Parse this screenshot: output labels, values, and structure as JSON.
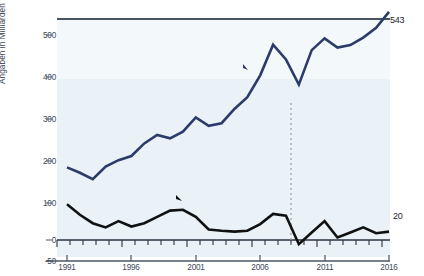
{
  "chart_data": {
    "type": "line",
    "title": "",
    "xlabel": "",
    "ylabel": "Angaben in Milliarden Euro",
    "xlim": [
      1991,
      2016
    ],
    "ylim": [
      -50,
      550
    ],
    "ytick_labels": [
      "500",
      "400",
      "300",
      "200",
      "100",
      "0",
      "-50"
    ],
    "ytick_values": [
      500,
      400,
      300,
      200,
      100,
      0,
      -50
    ],
    "xtick_labels": [
      "1991",
      "1996",
      "2001",
      "2006",
      "2011",
      "2016"
    ],
    "xtick_values": [
      1991,
      1996,
      2001,
      2006,
      2011,
      2016
    ],
    "grid": false,
    "legend_position": "inline-labels",
    "x": [
      1991,
      1992,
      1993,
      1994,
      1995,
      1996,
      1997,
      1998,
      1999,
      2000,
      2001,
      2002,
      2003,
      2004,
      2005,
      2006,
      2007,
      2008,
      2009,
      2010,
      2011,
      2012,
      2013,
      2014,
      2015,
      2016
    ],
    "series": [
      {
        "name": "Unternehmensgewinne",
        "color": "#2b3c6b",
        "values": [
          173,
          160,
          145,
          175,
          190,
          200,
          230,
          250,
          242,
          258,
          292,
          272,
          278,
          312,
          340,
          392,
          465,
          430,
          370,
          452,
          480,
          458,
          464,
          482,
          505,
          543
        ],
        "label_start": "173",
        "label_end": "543"
      },
      {
        "name": "Nettoinvestitionen",
        "color": "#111111",
        "values": [
          85,
          60,
          40,
          30,
          45,
          32,
          40,
          55,
          70,
          72,
          55,
          25,
          22,
          20,
          22,
          38,
          62,
          58,
          -10,
          18,
          45,
          6,
          18,
          30,
          16,
          20
        ],
        "label_start": "85",
        "label_end": "20"
      }
    ],
    "annotations": [
      {
        "text": "Wirtschaftskrise",
        "x": 2009,
        "note": "dashed vertical marker at 2009"
      }
    ]
  },
  "labels": {
    "axis_y_title": "Angaben in Milliarden Euro",
    "profit_tag": "Unternehmensgewinne",
    "invest_tag": "Nettoinvestitionen",
    "crisis": "Wirtschaftskrise",
    "profit_start": "173",
    "profit_end": "543",
    "invest_start": "85",
    "invest_end": "20"
  },
  "ytick_labels": [
    "500",
    "400",
    "300",
    "200",
    "100",
    "0",
    "-50"
  ],
  "xtick_labels": [
    "1991",
    "1996",
    "2001",
    "2006",
    "2011",
    "2016"
  ],
  "colors": {
    "profit_line": "#2b3c6b",
    "invest_line": "#111111",
    "plot_background": "#eaf2f7",
    "top_rule": "#4a5562",
    "crisis_dash": "#9aa3ad"
  }
}
